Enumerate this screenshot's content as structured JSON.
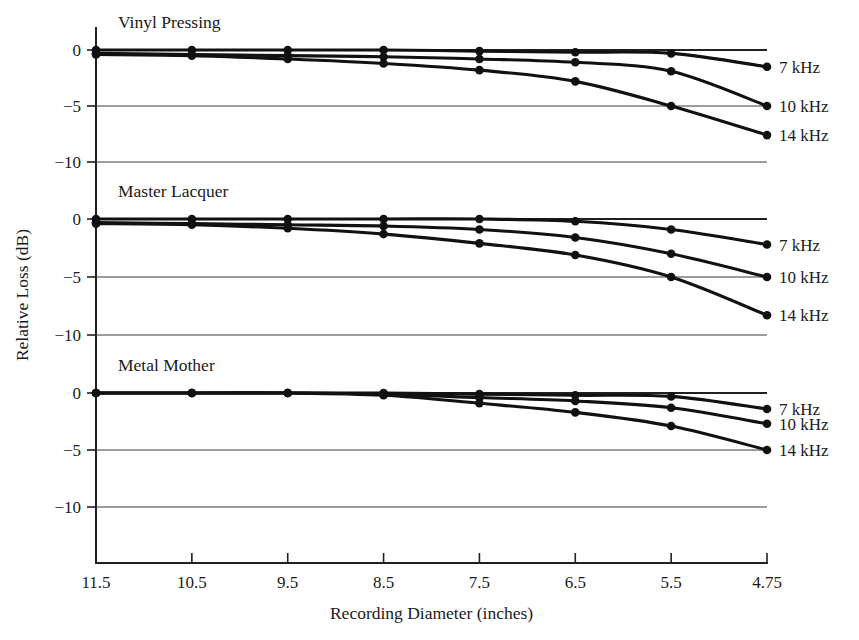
{
  "chart_data": {
    "type": "line",
    "title": "",
    "xlabel": "Recording Diameter (inches)",
    "ylabel": "Relative Loss (dB)",
    "x_tick_labels": [
      "11.5",
      "10.5",
      "9.5",
      "8.5",
      "7.5",
      "6.5",
      "5.5",
      "4.75"
    ],
    "x_values": [
      11.5,
      10.5,
      9.5,
      8.5,
      7.5,
      6.5,
      5.5,
      4.75
    ],
    "y_tick_labels": [
      "0",
      "-5",
      "-10"
    ],
    "ylim": [
      -12.5,
      1.5
    ],
    "grid": "horizontal",
    "legend_position": "right-of-curve-ends",
    "panels": [
      {
        "name": "Vinyl Pressing",
        "series": [
          {
            "name": "7 kHz",
            "label": "7 kHz",
            "x": [
              11.5,
              10.5,
              9.5,
              8.5,
              7.5,
              6.5,
              5.5,
              4.75
            ],
            "values": [
              0.0,
              0.0,
              0.0,
              0.0,
              -0.1,
              -0.2,
              -0.3,
              -1.5
            ]
          },
          {
            "name": "10 kHz",
            "label": "10 kHz",
            "x": [
              11.5,
              10.5,
              9.5,
              8.5,
              7.5,
              6.5,
              5.5,
              4.75
            ],
            "values": [
              -0.3,
              -0.4,
              -0.5,
              -0.6,
              -0.8,
              -1.1,
              -1.9,
              -5.0
            ]
          },
          {
            "name": "14 kHz",
            "label": "14 kHz",
            "x": [
              11.5,
              10.5,
              9.5,
              8.5,
              7.5,
              6.5,
              5.5,
              4.75
            ],
            "values": [
              -0.4,
              -0.5,
              -0.8,
              -1.2,
              -1.8,
              -2.8,
              -5.0,
              -7.6
            ]
          }
        ]
      },
      {
        "name": "Master Lacquer",
        "series": [
          {
            "name": "7 kHz",
            "label": "7 kHz",
            "x": [
              11.5,
              10.5,
              9.5,
              8.5,
              7.5,
              6.5,
              5.5,
              4.75
            ],
            "values": [
              0.0,
              0.0,
              0.0,
              0.0,
              0.0,
              -0.2,
              -0.9,
              -2.2
            ]
          },
          {
            "name": "10 kHz",
            "label": "10 kHz",
            "x": [
              11.5,
              10.5,
              9.5,
              8.5,
              7.5,
              6.5,
              5.5,
              4.75
            ],
            "values": [
              -0.3,
              -0.4,
              -0.5,
              -0.6,
              -0.9,
              -1.6,
              -3.0,
              -5.0
            ]
          },
          {
            "name": "14 kHz",
            "label": "14 kHz",
            "x": [
              11.5,
              10.5,
              9.5,
              8.5,
              7.5,
              6.5,
              5.5,
              4.75
            ],
            "values": [
              -0.4,
              -0.5,
              -0.8,
              -1.3,
              -2.1,
              -3.1,
              -5.0,
              -8.3
            ]
          }
        ]
      },
      {
        "name": "Metal Mother",
        "series": [
          {
            "name": "7 kHz",
            "label": "7 kHz",
            "x": [
              11.5,
              10.5,
              9.5,
              8.5,
              7.5,
              6.5,
              5.5,
              4.75
            ],
            "values": [
              0.0,
              0.0,
              0.0,
              0.0,
              -0.1,
              -0.2,
              -0.3,
              -1.4
            ]
          },
          {
            "name": "10 kHz",
            "label": "10 kHz",
            "x": [
              11.5,
              10.5,
              9.5,
              8.5,
              7.5,
              6.5,
              5.5,
              4.75
            ],
            "values": [
              0.0,
              0.0,
              0.0,
              -0.1,
              -0.4,
              -0.7,
              -1.3,
              -2.7
            ]
          },
          {
            "name": "14 kHz",
            "label": "14 kHz",
            "x": [
              11.5,
              10.5,
              9.5,
              8.5,
              7.5,
              6.5,
              5.5,
              4.75
            ],
            "values": [
              0.0,
              0.0,
              0.0,
              -0.2,
              -0.9,
              -1.7,
              -2.9,
              -5.0
            ]
          }
        ]
      }
    ],
    "colors": {
      "curve": "#111111",
      "axis": "#231f20",
      "grid": "#3c3a3b",
      "background": "#ffffff"
    }
  }
}
